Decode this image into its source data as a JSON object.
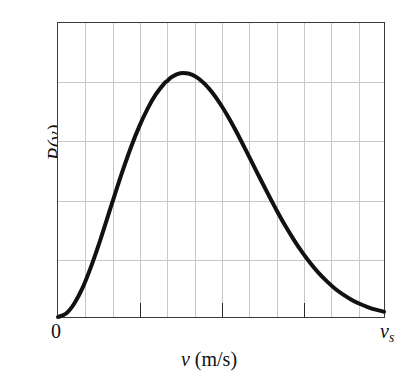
{
  "figure": {
    "background_color": "#ffffff",
    "frame_color": "#3a3a3a",
    "grid_color": "#c8c8c8",
    "curve_color": "#111111",
    "origin_label": "0",
    "right_axis_label_base": "v",
    "right_axis_label_sub": "s",
    "xlabel_symbol": "v",
    "xlabel_units": "(m/s)",
    "ylabel": "P(v)"
  },
  "chart_data": {
    "type": "line",
    "title": "",
    "subtitle": "",
    "xlabel": "v (m/s)",
    "ylabel": "P(v)",
    "legend": [],
    "legend_position": "none",
    "grid": true,
    "grid_vertical_count": 11,
    "grid_horizontal_count": 4,
    "xlim": [
      0,
      1
    ],
    "ylim": [
      0,
      1
    ],
    "xtick_labels": [
      "0",
      "v_s"
    ],
    "xtick_positions": [
      0,
      1
    ],
    "xtick_major_positions": [
      0.25,
      0.5,
      0.75
    ],
    "ytick_labels": [],
    "annotations": [],
    "series": [
      {
        "name": "Maxwell-Boltzmann speed distribution",
        "color": "#111111",
        "linewidth": 4,
        "peak_x": 0.335,
        "peak_y": 0.83,
        "x": [
          0.0,
          0.025,
          0.05,
          0.075,
          0.1,
          0.125,
          0.15,
          0.175,
          0.2,
          0.225,
          0.25,
          0.275,
          0.3,
          0.325,
          0.335,
          0.35,
          0.375,
          0.4,
          0.425,
          0.45,
          0.475,
          0.5,
          0.525,
          0.55,
          0.575,
          0.6,
          0.625,
          0.65,
          0.675,
          0.7,
          0.725,
          0.75,
          0.775,
          0.8,
          0.825,
          0.85,
          0.875,
          0.9,
          0.925,
          0.95,
          0.975,
          1.0
        ],
        "y": [
          0.0,
          0.012,
          0.046,
          0.098,
          0.167,
          0.246,
          0.332,
          0.419,
          0.503,
          0.581,
          0.65,
          0.709,
          0.757,
          0.793,
          0.803,
          0.817,
          0.829,
          0.828,
          0.816,
          0.793,
          0.761,
          0.721,
          0.675,
          0.624,
          0.57,
          0.515,
          0.46,
          0.406,
          0.354,
          0.305,
          0.26,
          0.219,
          0.182,
          0.149,
          0.121,
          0.096,
          0.076,
          0.059,
          0.045,
          0.034,
          0.025,
          0.018
        ]
      }
    ]
  }
}
